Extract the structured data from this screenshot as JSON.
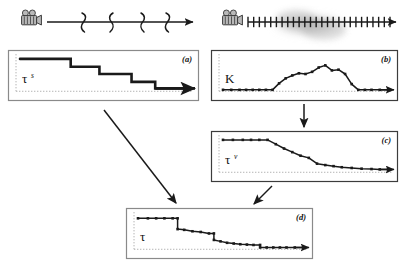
{
  "figure": {
    "type": "diagram",
    "background_color": "#ffffff",
    "ink_color": "#1a1a1a",
    "panel_border_color": "#8a8a8a",
    "panel_border_color_dark": "#3c3c3c",
    "dotted_axis_color": "#b4b4b4"
  },
  "timelines": [
    {
      "id": "timeline-sparse",
      "icon": "movie-camera-icon",
      "tick_style": "squiggle",
      "tick_count": 4,
      "axis": {
        "x1": 47,
        "x2": 196,
        "y": 22
      },
      "tick_positions": [
        84,
        113,
        142,
        166
      ]
    },
    {
      "id": "timeline-dense",
      "icon": "movie-camera-icon",
      "tick_style": "straight",
      "tick_count": 26,
      "axis": {
        "x1": 248,
        "x2": 398,
        "y": 22
      },
      "cloud": {
        "cx": 310,
        "cy": 24,
        "rx": 44,
        "ry": 18,
        "label": "blur-cloud"
      }
    }
  ],
  "panels": [
    {
      "id": "panel-a",
      "label": "(a)",
      "curve_label": "τ",
      "curve_label_sup": "s",
      "curve_name": "tau-s",
      "style": "staircase",
      "markers": false,
      "stroke_width": 2.6,
      "border": "#8a8a8a",
      "box": {
        "x": 8,
        "y": 50,
        "w": 190,
        "h": 50
      },
      "chart_data": {
        "type": "line",
        "title": "tau^s",
        "xlabel": "",
        "ylabel": "",
        "xlim": [
          0,
          1
        ],
        "ylim": [
          0,
          1
        ],
        "grid": false,
        "x": [
          0.0,
          0.3,
          0.3,
          0.47,
          0.47,
          0.66,
          0.66,
          0.8,
          0.8,
          1.0
        ],
        "y": [
          0.92,
          0.92,
          0.7,
          0.7,
          0.5,
          0.5,
          0.28,
          0.28,
          0.1,
          0.1
        ]
      }
    },
    {
      "id": "panel-b",
      "label": "(b)",
      "curve_label": "Κ",
      "curve_label_sup": "",
      "curve_name": "kappa",
      "style": "polyline-markers",
      "markers": true,
      "stroke_width": 1.5,
      "border": "#3c3c3c",
      "box": {
        "x": 211,
        "y": 50,
        "w": 186,
        "h": 50
      },
      "chart_data": {
        "type": "line",
        "title": "K",
        "xlabel": "",
        "ylabel": "",
        "xlim": [
          0,
          1
        ],
        "ylim": [
          0,
          1
        ],
        "grid": false,
        "x": [
          0.0,
          0.05,
          0.1,
          0.14,
          0.18,
          0.22,
          0.26,
          0.3,
          0.34,
          0.38,
          0.42,
          0.46,
          0.5,
          0.54,
          0.58,
          0.62,
          0.66,
          0.7,
          0.74,
          0.78,
          0.82,
          0.86,
          0.9,
          0.95,
          1.0
        ],
        "y": [
          0.06,
          0.06,
          0.06,
          0.06,
          0.06,
          0.06,
          0.06,
          0.06,
          0.24,
          0.38,
          0.46,
          0.52,
          0.5,
          0.56,
          0.68,
          0.74,
          0.6,
          0.62,
          0.5,
          0.22,
          0.06,
          0.06,
          0.06,
          0.06,
          0.06
        ]
      }
    },
    {
      "id": "panel-c",
      "label": "(c)",
      "curve_label": "τ",
      "curve_label_sup": "v",
      "curve_name": "tau-v",
      "style": "polyline-markers",
      "markers": true,
      "stroke_width": 1.5,
      "border": "#3c3c3c",
      "box": {
        "x": 211,
        "y": 131,
        "w": 186,
        "h": 50
      },
      "chart_data": {
        "type": "line",
        "title": "tau^v",
        "xlabel": "",
        "ylabel": "",
        "xlim": [
          0,
          1
        ],
        "ylim": [
          0,
          1
        ],
        "grid": false,
        "x": [
          0.0,
          0.06,
          0.12,
          0.17,
          0.22,
          0.27,
          0.32,
          0.37,
          0.42,
          0.47,
          0.52,
          0.57,
          0.62,
          0.67,
          0.72,
          0.78,
          0.84,
          0.9,
          0.95,
          1.0
        ],
        "y": [
          0.92,
          0.92,
          0.92,
          0.92,
          0.92,
          0.92,
          0.8,
          0.68,
          0.58,
          0.48,
          0.42,
          0.26,
          0.22,
          0.19,
          0.16,
          0.14,
          0.12,
          0.11,
          0.1,
          0.1
        ]
      }
    },
    {
      "id": "panel-d",
      "label": "(d)",
      "curve_label": "τ",
      "curve_label_sup": "",
      "curve_name": "tau",
      "style": "polyline-markers",
      "markers": true,
      "stroke_width": 1.5,
      "border": "#8a8a8a",
      "box": {
        "x": 126,
        "y": 208,
        "w": 186,
        "h": 50
      },
      "chart_data": {
        "type": "line",
        "title": "tau",
        "xlabel": "",
        "ylabel": "",
        "xlim": [
          0,
          1
        ],
        "ylim": [
          0,
          1
        ],
        "grid": false,
        "x": [
          0.0,
          0.06,
          0.11,
          0.16,
          0.21,
          0.24,
          0.24,
          0.28,
          0.33,
          0.38,
          0.43,
          0.46,
          0.46,
          0.5,
          0.54,
          0.58,
          0.62,
          0.66,
          0.7,
          0.74,
          0.74,
          0.78,
          0.82,
          0.86,
          0.9,
          0.95,
          1.0
        ],
        "y": [
          0.88,
          0.88,
          0.88,
          0.88,
          0.88,
          0.88,
          0.58,
          0.56,
          0.52,
          0.5,
          0.46,
          0.46,
          0.28,
          0.24,
          0.2,
          0.18,
          0.16,
          0.15,
          0.14,
          0.14,
          0.07,
          0.07,
          0.07,
          0.07,
          0.07,
          0.07,
          0.07
        ]
      }
    }
  ],
  "arrows": [
    {
      "id": "arrow-a-to-d",
      "from": "panel-a",
      "to": "panel-d",
      "x1": 104,
      "y1": 110,
      "x2": 176,
      "y2": 203
    },
    {
      "id": "arrow-b-to-c",
      "from": "panel-b",
      "to": "panel-c",
      "x1": 304,
      "y1": 104,
      "x2": 304,
      "y2": 127
    },
    {
      "id": "arrow-c-to-d",
      "from": "panel-c",
      "to": "panel-d",
      "x1": 272,
      "y1": 186,
      "x2": 254,
      "y2": 204
    }
  ]
}
